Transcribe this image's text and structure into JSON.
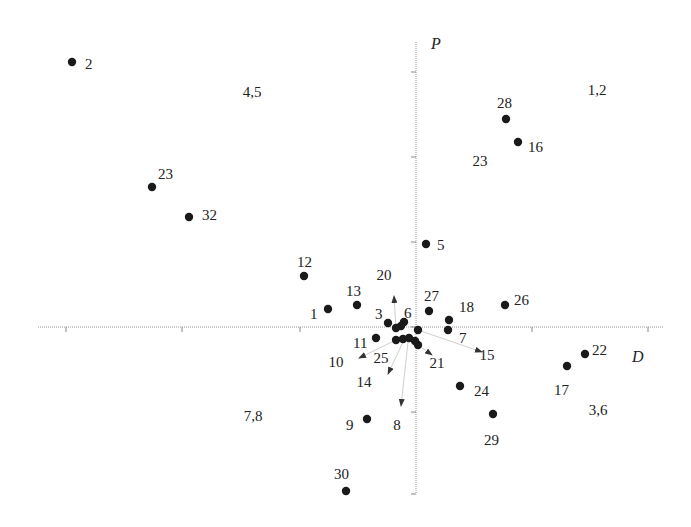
{
  "chart_data": {
    "type": "scatter",
    "title": "",
    "xlabel": "D",
    "ylabel": "P",
    "grid": false,
    "axes": {
      "origin_px": [
        416,
        327
      ],
      "x_axis_px": [
        38,
        664
      ],
      "y_axis_px": [
        42,
        494
      ],
      "x_ticks_px": [
        66,
        182,
        300,
        416,
        532,
        648
      ],
      "y_ticks_px": [
        72,
        157,
        242,
        327,
        412,
        494
      ]
    },
    "quadrant_labels": [
      {
        "text": "4,5",
        "x": 252,
        "y": 97
      },
      {
        "text": "1,2",
        "x": 597,
        "y": 95
      },
      {
        "text": "23",
        "x": 480,
        "y": 166
      },
      {
        "text": "7,8",
        "x": 253,
        "y": 421
      },
      {
        "text": "3,6",
        "x": 598,
        "y": 415
      }
    ],
    "points": [
      {
        "id": "2",
        "x": 72,
        "y": 62,
        "lx": 85,
        "ly": 64
      },
      {
        "id": "23",
        "x": 152,
        "y": 187,
        "lx": 158,
        "ly": 174
      },
      {
        "id": "32",
        "x": 189,
        "y": 217,
        "lx": 202,
        "ly": 215
      },
      {
        "id": "28",
        "x": 506,
        "y": 119,
        "lx": 497,
        "ly": 103
      },
      {
        "id": "16",
        "x": 518,
        "y": 142,
        "lx": 528,
        "ly": 147
      },
      {
        "id": "5",
        "x": 426,
        "y": 244,
        "lx": 437,
        "ly": 245
      },
      {
        "id": "12",
        "x": 304,
        "y": 276,
        "lx": 297,
        "ly": 262
      },
      {
        "id": "13",
        "x": 357,
        "y": 305,
        "lx": 346,
        "ly": 291
      },
      {
        "id": "1",
        "x": 328,
        "y": 309,
        "lx": 310,
        "ly": 314
      },
      {
        "id": "27",
        "x": 429,
        "y": 311,
        "lx": 424,
        "ly": 296
      },
      {
        "id": "18",
        "x": 449,
        "y": 320,
        "lx": 459,
        "ly": 307
      },
      {
        "id": "26",
        "x": 505,
        "y": 305,
        "lx": 514,
        "ly": 300
      },
      {
        "id": "3",
        "x": 388,
        "y": 323,
        "lx": 375,
        "ly": 314
      },
      {
        "id": "6",
        "x": 404,
        "y": 322,
        "lx": 404,
        "ly": 313
      },
      {
        "id": "7",
        "x": 448,
        "y": 330,
        "lx": 459,
        "ly": 338
      },
      {
        "id": "11",
        "x": 376,
        "y": 338,
        "lx": 353,
        "ly": 343
      },
      {
        "id": "9",
        "x": 367,
        "y": 419,
        "lx": 346,
        "ly": 425
      },
      {
        "id": "24",
        "x": 460,
        "y": 386,
        "lx": 474,
        "ly": 391
      },
      {
        "id": "29",
        "x": 493,
        "y": 414,
        "lx": 484,
        "ly": 440
      },
      {
        "id": "17",
        "x": 567,
        "y": 366,
        "lx": 554,
        "ly": 390
      },
      {
        "id": "22",
        "x": 585,
        "y": 354,
        "lx": 592,
        "ly": 350
      },
      {
        "id": "30",
        "x": 346,
        "y": 491,
        "lx": 334,
        "ly": 474
      },
      {
        "id": "",
        "x": 396,
        "y": 328,
        "lx": null,
        "ly": null
      },
      {
        "id": "",
        "x": 401,
        "y": 326,
        "lx": null,
        "ly": null
      },
      {
        "id": "",
        "x": 418,
        "y": 330,
        "lx": null,
        "ly": null
      },
      {
        "id": "",
        "x": 396,
        "y": 340,
        "lx": null,
        "ly": null
      },
      {
        "id": "",
        "x": 403,
        "y": 339,
        "lx": null,
        "ly": null
      },
      {
        "id": "",
        "x": 409,
        "y": 338,
        "lx": null,
        "ly": null
      },
      {
        "id": "",
        "x": 415,
        "y": 341,
        "lx": null,
        "ly": null
      },
      {
        "id": "",
        "x": 418,
        "y": 345,
        "lx": null,
        "ly": null
      }
    ],
    "arrows": [
      {
        "id": "20",
        "x1": 396,
        "y1": 328,
        "x2": 394,
        "y2": 296,
        "lx": 384,
        "ly": 280
      },
      {
        "id": "10",
        "x1": 396,
        "y1": 340,
        "x2": 359,
        "y2": 358,
        "lx": 336,
        "ly": 367
      },
      {
        "id": "25",
        "x1": 403,
        "y1": 340,
        "x2": 403,
        "y2": 340,
        "lx": 381,
        "ly": 363
      },
      {
        "id": "14",
        "x1": 403,
        "y1": 342,
        "x2": 388,
        "y2": 374,
        "lx": 364,
        "ly": 387
      },
      {
        "id": "8",
        "x1": 408,
        "y1": 342,
        "x2": 401,
        "y2": 406,
        "lx": 397,
        "ly": 430
      },
      {
        "id": "21",
        "x1": 418,
        "y1": 345,
        "x2": 432,
        "y2": 355,
        "lx": 437,
        "ly": 368
      },
      {
        "id": "15",
        "x1": 418,
        "y1": 330,
        "x2": 482,
        "y2": 352,
        "lx": 487,
        "ly": 360
      }
    ],
    "axis_labels": {
      "P": {
        "text": "P",
        "x": 431,
        "y": 49
      },
      "D": {
        "text": "D",
        "x": 632,
        "y": 362
      }
    }
  }
}
